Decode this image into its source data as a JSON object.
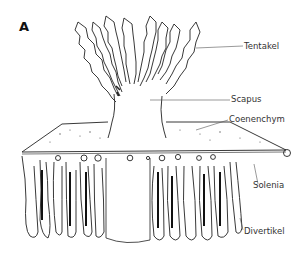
{
  "figure": {
    "panel_letter": "A",
    "labels": [
      {
        "id": "tentakel",
        "text": "Tentakel"
      },
      {
        "id": "scapus",
        "text": "Scapus"
      },
      {
        "id": "coenenchym",
        "text": "Coenenchym"
      },
      {
        "id": "solenia",
        "text": "Solenia"
      },
      {
        "id": "divertikel",
        "text": "Divertikel"
      }
    ],
    "colors": {
      "ink": "#222222",
      "leader": "#555555",
      "background": "#ffffff"
    }
  }
}
